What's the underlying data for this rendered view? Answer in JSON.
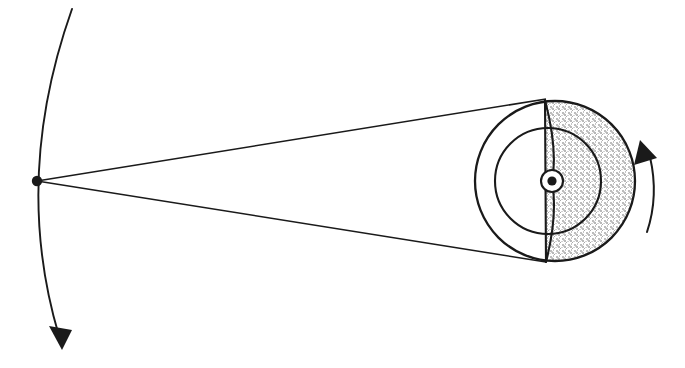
{
  "figure": {
    "title": "Rotating disc viewed from a distant point",
    "type": "line-diagram",
    "background_color": "#ffffff",
    "ink_color": "#1a1a1a",
    "shade_color": "#c9c9c9",
    "canvas": {
      "width": 685,
      "height": 368
    }
  },
  "elements": {
    "vertex_point": {
      "name": "observation-point",
      "cx": 37,
      "cy": 181,
      "r": 5.2
    },
    "orbit_arc": {
      "name": "orbit-arc",
      "start": {
        "x": 72,
        "y": 9
      },
      "control": {
        "x": 12,
        "y": 178
      },
      "end": {
        "x": 59,
        "y": 336
      },
      "stroke_width": 1.9
    },
    "orbit_arrow": {
      "name": "orbit-direction-arrowhead",
      "tip": {
        "x": 62,
        "y": 350
      },
      "left": {
        "x": 49,
        "y": 326
      },
      "right": {
        "x": 72,
        "y": 330
      }
    },
    "sight_line_upper": {
      "name": "upper-sight-line",
      "from": {
        "x": 37,
        "y": 181
      },
      "to": {
        "x": 546,
        "y": 99
      },
      "stroke_width": 1.5
    },
    "sight_line_lower": {
      "name": "lower-sight-line",
      "from": {
        "x": 37,
        "y": 181
      },
      "to": {
        "x": 546,
        "y": 262
      },
      "stroke_width": 1.5
    },
    "outer_circle": {
      "name": "outer-disc",
      "cx": 555,
      "cy": 181,
      "r": 80,
      "stroke_width": 2.3
    },
    "inner_circle": {
      "name": "inner-disc",
      "cx": 548,
      "cy": 181,
      "r": 53,
      "stroke_width": 2.1
    },
    "hub_outer": {
      "name": "hub-ring",
      "cx": 552,
      "cy": 181,
      "r": 11,
      "stroke_width": 2.1
    },
    "hub_core": {
      "name": "hub-center-dot",
      "cx": 552,
      "cy": 181,
      "r": 4.6
    },
    "vane_straight": {
      "name": "vane-straight-edge",
      "from": {
        "x": 545,
        "y": 100
      },
      "to": {
        "x": 546,
        "y": 262
      },
      "stroke_width": 2.1
    },
    "vane_bowed": {
      "name": "vane-bowed-edge",
      "from": {
        "x": 545,
        "y": 100
      },
      "control_upper": {
        "x": 558,
        "y": 150
      },
      "mid": {
        "x": 552,
        "y": 181
      },
      "control_lower": {
        "x": 558,
        "y": 215
      },
      "to": {
        "x": 546,
        "y": 262
      },
      "stroke_width": 2.1
    },
    "shaded_half": {
      "name": "shaded-half-disc",
      "description": "right half of outer disc filled with light stipple",
      "center": {
        "x": 555,
        "y": 181
      },
      "radius": 80,
      "edge_x": 546
    },
    "rotation_arrow": {
      "name": "rotation-direction-arc-arrow",
      "arc_start": {
        "x": 647,
        "y": 232
      },
      "arc_control": {
        "x": 659,
        "y": 196
      },
      "arc_end": {
        "x": 650,
        "y": 157
      },
      "stroke_width": 2.0,
      "tip": {
        "x": 640,
        "y": 140
      },
      "base_left": {
        "x": 634,
        "y": 165
      },
      "base_right": {
        "x": 657,
        "y": 158
      }
    }
  }
}
